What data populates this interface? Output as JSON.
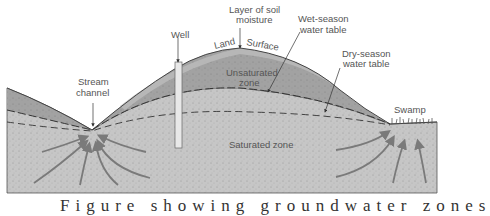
{
  "labels": {
    "well": "Well",
    "layer_soil_moisture_1": "Layer of soil",
    "layer_soil_moisture_2": "moisture",
    "land": "Land",
    "surface": "Surface",
    "wet_season_1": "Wet-season",
    "wet_season_2": "water table",
    "dry_season_1": "Dry-season",
    "dry_season_2": "water table",
    "stream_1": "Stream",
    "stream_2": "channel",
    "unsaturated_1": "Unsaturated",
    "unsaturated_2": "zone",
    "saturated": "Saturated zone",
    "swamp": "Swamp"
  },
  "caption": "Figure showing groundwater zones",
  "colors": {
    "saturated": "#c4c4c4",
    "unsaturated": "#9e9e9e",
    "soil_layer": "#b8b8b8",
    "arrow": "#7a7a7a",
    "line": "#333333",
    "text": "#555555"
  }
}
